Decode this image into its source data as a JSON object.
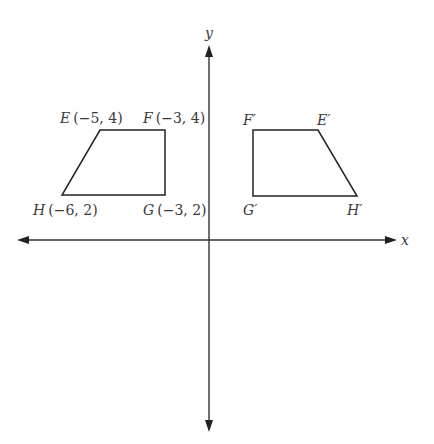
{
  "diagram": {
    "type": "coordinate-plane-reflection",
    "axes": {
      "x_label": "x",
      "y_label": "y",
      "color": "#333333"
    },
    "original_shape": {
      "name": "EFGH",
      "vertices": [
        {
          "name": "E",
          "coords": "(−5, 4)",
          "x": -5,
          "y": 4
        },
        {
          "name": "F",
          "coords": "(−3, 4)",
          "x": -3,
          "y": 4
        },
        {
          "name": "G",
          "coords": "(−3, 2)",
          "x": -3,
          "y": 2
        },
        {
          "name": "H",
          "coords": "(−6, 2)",
          "x": -6,
          "y": 2
        }
      ]
    },
    "image_shape": {
      "name": "E'F'G'H'",
      "vertices": [
        {
          "name": "E′"
        },
        {
          "name": "F′"
        },
        {
          "name": "G′"
        },
        {
          "name": "H′"
        }
      ]
    },
    "line_color": "#222222",
    "text_color": "#3a3a3a"
  }
}
